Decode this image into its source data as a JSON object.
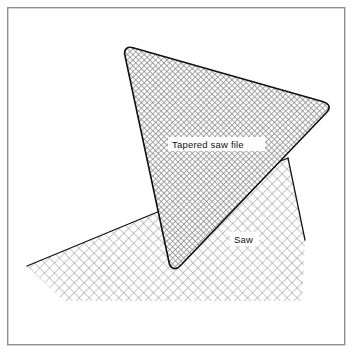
{
  "figure": {
    "width": 353,
    "height": 353,
    "background_color": "#ffffff",
    "frame": {
      "name": "figure-border",
      "color": "#8f8f8f",
      "stroke_width": 1.4,
      "x": 7,
      "y": 7,
      "width": 338,
      "height": 338
    }
  },
  "labels": [
    {
      "id": "tapered-saw-file",
      "text": "Tapered saw file",
      "x": 172,
      "y": 148,
      "plate_x": 168,
      "plate_y": 138,
      "plate_width": 96,
      "plate_height": 14,
      "color": "#111111"
    },
    {
      "id": "saw",
      "text": "Saw",
      "x": 234,
      "y": 243,
      "plate_x": 230,
      "plate_y": 233,
      "plate_width": 28,
      "plate_height": 14,
      "color": "#111111"
    }
  ],
  "shapes": {
    "saw": {
      "name": "saw-blade",
      "fill_pattern": "coarse-crosshatch",
      "fill_color": "#9a9a9a",
      "outline_color": "#111111",
      "outline_width": 1.25,
      "points": "27,266 288,158 305,240 302,300 66,300",
      "outline_path": "M27,266 L288,158 M288,158 L305,240",
      "bottom_edge_open": true
    },
    "file": {
      "name": "tapered-saw-file",
      "fill_pattern": "fine-checker",
      "fill_color": "#8a8a8a",
      "outline_color": "#111111",
      "outline_width": 1.6,
      "corner_radius": 7,
      "vertices": [
        {
          "id": "top-left",
          "x": 124,
          "y": 46
        },
        {
          "id": "right",
          "x": 331,
          "y": 106
        },
        {
          "id": "bottom",
          "x": 173,
          "y": 268
        }
      ]
    }
  }
}
